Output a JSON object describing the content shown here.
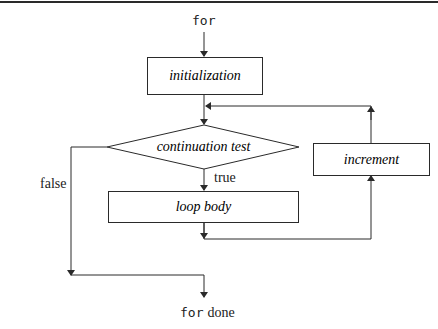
{
  "diagram": {
    "type": "flowchart",
    "entry": {
      "keyword": "for"
    },
    "exit": {
      "keyword": "for",
      "suffix": "done"
    },
    "nodes": [
      {
        "id": "initialization",
        "shape": "rectangle",
        "label": "initialization"
      },
      {
        "id": "continuation_test",
        "shape": "diamond",
        "label": "continuation test"
      },
      {
        "id": "loop_body",
        "shape": "rectangle",
        "label": "loop body"
      },
      {
        "id": "increment",
        "shape": "rectangle",
        "label": "increment"
      }
    ],
    "edges": [
      {
        "from": "for",
        "to": "initialization",
        "label": ""
      },
      {
        "from": "initialization",
        "to": "continuation_test",
        "label": ""
      },
      {
        "from": "continuation_test",
        "to": "loop_body",
        "label": "true"
      },
      {
        "from": "continuation_test",
        "to": "for done",
        "label": "false"
      },
      {
        "from": "loop_body",
        "to": "increment",
        "label": ""
      },
      {
        "from": "increment",
        "to": "continuation_test",
        "label": ""
      }
    ],
    "edge_labels": {
      "true": "true",
      "false": "false"
    },
    "colors": {
      "line": "#2a2a2a",
      "text": "#222222",
      "background": "#ffffff"
    }
  }
}
